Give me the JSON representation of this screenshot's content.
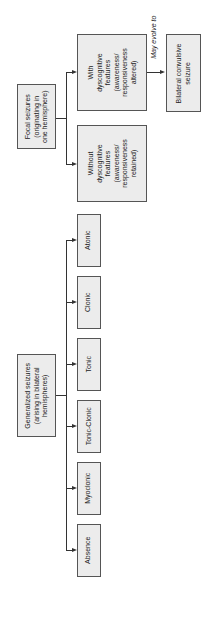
{
  "diagram": {
    "focal": {
      "root": [
        "Focal seizures",
        "(originating in",
        "one hemisphere)"
      ],
      "without": [
        "Without",
        "dyscognitive",
        "features",
        "(awareness/",
        "responsiveness",
        "retained)"
      ],
      "with": [
        "With",
        "dyscognitive",
        "features",
        "(awareness/",
        "responsiveness",
        "altered)"
      ],
      "evolve_label": "May evolve to",
      "bilateral": [
        "Bilateral convulsive",
        "seizure"
      ]
    },
    "generalized": {
      "root": [
        "Generalized seizures",
        "(arising in bilateral",
        "hemispheres)"
      ],
      "types": [
        "Atonic",
        "Clonic",
        "Tonic",
        "Tonic-Clonic",
        "Myoclonic",
        "Absence"
      ]
    }
  }
}
